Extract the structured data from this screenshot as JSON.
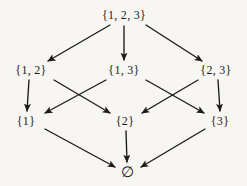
{
  "figure": {
    "background_color": "#f7f6f3",
    "ink_color": "#1d1b18",
    "width": 247,
    "height": 186
  },
  "nodes": [
    {
      "id": "n123",
      "label": "{1, 2, 3}",
      "x": 124,
      "y": 15,
      "level": 0
    },
    {
      "id": "n12",
      "label": "{1, 2}",
      "x": 31,
      "y": 70,
      "level": 1
    },
    {
      "id": "n13",
      "label": "{1, 3}",
      "x": 124,
      "y": 70,
      "level": 1
    },
    {
      "id": "n23",
      "label": "{2, 3}",
      "x": 216,
      "y": 70,
      "level": 1
    },
    {
      "id": "n1",
      "label": "{1}",
      "x": 26,
      "y": 121,
      "level": 2
    },
    {
      "id": "n2",
      "label": "{2}",
      "x": 125,
      "y": 121,
      "level": 2
    },
    {
      "id": "n3",
      "label": "{3}",
      "x": 220,
      "y": 121,
      "level": 2
    },
    {
      "id": "nempty",
      "label": "∅",
      "x": 128,
      "y": 172,
      "level": 3
    }
  ],
  "edges": [
    {
      "id": "e1",
      "from": "n123",
      "to": "n12",
      "x1": 110,
      "y1": 25,
      "x2": 48,
      "y2": 61
    },
    {
      "id": "e2",
      "from": "n123",
      "to": "n13",
      "x1": 124,
      "y1": 26,
      "x2": 124,
      "y2": 60
    },
    {
      "id": "e3",
      "from": "n123",
      "to": "n23",
      "x1": 146,
      "y1": 25,
      "x2": 202,
      "y2": 61
    },
    {
      "id": "e4",
      "from": "n12",
      "to": "n1",
      "x1": 29,
      "y1": 80,
      "x2": 27,
      "y2": 111
    },
    {
      "id": "e5",
      "from": "n12",
      "to": "n2",
      "x1": 54,
      "y1": 80,
      "x2": 110,
      "y2": 113
    },
    {
      "id": "e6",
      "from": "n13",
      "to": "n1",
      "x1": 106,
      "y1": 80,
      "x2": 45,
      "y2": 113
    },
    {
      "id": "e7",
      "from": "n13",
      "to": "n3",
      "x1": 146,
      "y1": 80,
      "x2": 204,
      "y2": 113
    },
    {
      "id": "e8",
      "from": "n23",
      "to": "n2",
      "x1": 198,
      "y1": 80,
      "x2": 142,
      "y2": 113
    },
    {
      "id": "e9",
      "from": "n23",
      "to": "n3",
      "x1": 218,
      "y1": 80,
      "x2": 220,
      "y2": 111
    },
    {
      "id": "e10",
      "from": "n1",
      "to": "nempty",
      "x1": 45,
      "y1": 129,
      "x2": 115,
      "y2": 167
    },
    {
      "id": "e11",
      "from": "n2",
      "to": "nempty",
      "x1": 126,
      "y1": 131,
      "x2": 127,
      "y2": 162
    },
    {
      "id": "e12",
      "from": "n3",
      "to": "nempty",
      "x1": 205,
      "y1": 129,
      "x2": 141,
      "y2": 167
    }
  ]
}
